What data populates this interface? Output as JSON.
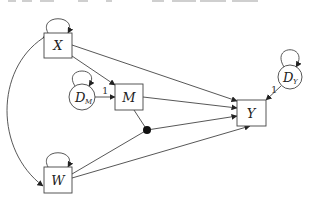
{
  "diagram": {
    "type": "path-model",
    "colors": {
      "stroke": "#444444",
      "fill": "#ffffff",
      "dot": "#111111",
      "text": "#222222"
    },
    "nodes": [
      {
        "id": "X",
        "shape": "box",
        "label": "X",
        "x": 44,
        "y": 33,
        "w": 28,
        "h": 25
      },
      {
        "id": "M",
        "shape": "box",
        "label": "M",
        "x": 115,
        "y": 84,
        "w": 28,
        "h": 26
      },
      {
        "id": "W",
        "shape": "box",
        "label": "W",
        "x": 44,
        "y": 167,
        "w": 28,
        "h": 26
      },
      {
        "id": "Y",
        "shape": "box",
        "label": "Y",
        "x": 237,
        "y": 100,
        "w": 29,
        "h": 26
      },
      {
        "id": "DM",
        "shape": "circle",
        "label": "D",
        "subscript": "M",
        "cx": 82,
        "cy": 97,
        "r": 13
      },
      {
        "id": "DY",
        "shape": "circle",
        "label": "D",
        "subscript": "Y",
        "cx": 290,
        "cy": 77,
        "r": 12
      }
    ],
    "interaction_point": {
      "cx": 147,
      "cy": 130,
      "r": 4
    },
    "edges": [
      {
        "from": "X",
        "to": "M",
        "label": ""
      },
      {
        "from": "X",
        "to": "Y",
        "label": ""
      },
      {
        "from": "M",
        "to": "Y",
        "label": ""
      },
      {
        "from": "DM",
        "to": "M",
        "label": "1"
      },
      {
        "from": "DY",
        "to": "Y",
        "label": "1"
      },
      {
        "from": "W",
        "to": "Y",
        "label": ""
      },
      {
        "from": "M",
        "to": "interaction",
        "label": ""
      },
      {
        "from": "W",
        "to": "interaction",
        "label": ""
      },
      {
        "from": "interaction",
        "to": "Y",
        "label": ""
      },
      {
        "from": "X",
        "to": "W",
        "label": "",
        "kind": "covariance"
      }
    ],
    "self_loops": [
      "X",
      "DM",
      "W",
      "DY"
    ],
    "edge_labels": {
      "dm_to_m": "1",
      "dy_to_y": "1"
    }
  }
}
